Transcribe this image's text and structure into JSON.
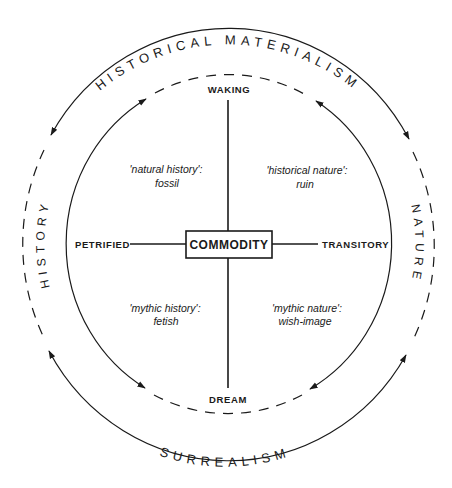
{
  "diagram": {
    "center": "COMMODITY",
    "poles": {
      "top": "WAKING",
      "bottom": "DREAM",
      "left": "PETRIFIED",
      "right": "TRANSITORY"
    },
    "quadrants": {
      "top_left": {
        "term": "'natural history':",
        "image": "fossil"
      },
      "top_right": {
        "term": "'historical nature':",
        "image": "ruin"
      },
      "bottom_left": {
        "term": "'mythic history':",
        "image": "fetish"
      },
      "bottom_right": {
        "term": "'mythic nature':",
        "image": "wish-image"
      }
    },
    "arc_labels": {
      "top": "HISTORICAL MATERIALISM",
      "bottom": "SURREALISM",
      "left": "HISTORY",
      "right": "NATURE"
    },
    "colors": {
      "ink": "#1a1a1a",
      "background": "#ffffff"
    }
  }
}
